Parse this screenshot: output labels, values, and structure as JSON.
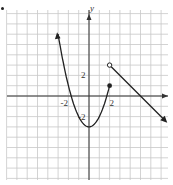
{
  "chart_data": {
    "type": "line",
    "title": "",
    "xlabel": "",
    "ylabel": "y",
    "xlim": [
      -8,
      8
    ],
    "ylim": [
      -8,
      8
    ],
    "grid": true,
    "tick_labels": {
      "x": [
        {
          "value": -2,
          "label": "-2"
        },
        {
          "value": 2,
          "label": "2"
        }
      ],
      "y": [
        {
          "value": 2,
          "label": "2"
        },
        {
          "value": -2,
          "label": "-2"
        }
      ]
    },
    "series": [
      {
        "name": "parabola piece",
        "description": "y = x^2 - 3 for x <= 2, arrow at left end, closed dot at (2,1)",
        "x": [
          -3,
          -2.5,
          -2,
          -1.5,
          -1,
          -0.5,
          0,
          0.5,
          1,
          1.5,
          2
        ],
        "values": [
          6,
          3.25,
          1,
          -0.75,
          -2,
          -2.75,
          -3,
          -2.75,
          -2,
          -0.75,
          1
        ],
        "start_marker": "arrow",
        "end_marker": "closed-dot"
      },
      {
        "name": "line piece",
        "description": "line from open circle at (2,3) decreasing with slope -1, arrow at right end",
        "x": [
          2,
          7.5
        ],
        "values": [
          3,
          -2.5
        ],
        "start_marker": "open-circle",
        "end_marker": "arrow"
      }
    ],
    "points": [
      {
        "x": 2,
        "y": 1,
        "style": "closed"
      },
      {
        "x": 2,
        "y": 3,
        "style": "open"
      }
    ]
  },
  "colors": {
    "grid": "#c8c8c8",
    "axis": "#333333",
    "curve": "#222222"
  }
}
